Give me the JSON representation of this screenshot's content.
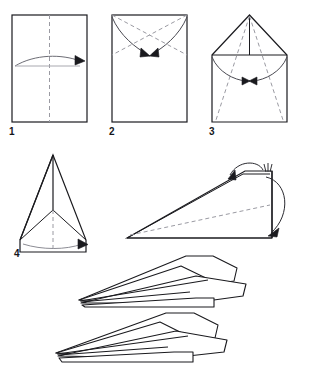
{
  "figure": {
    "type": "instructional-diagram",
    "background_color": "#ffffff",
    "ink_color": "#1a1a1e",
    "fold_line_color": "#9a9aa2",
    "arrow_color": "#6d6d75",
    "width": 311,
    "height": 376
  },
  "steps": [
    {
      "id": "step-1",
      "label": "1",
      "caption": "Rectangular sheet with vertical centre fold; fold in half and unfold.",
      "shape": "rectangle",
      "fold_lines": [
        "vertical-center-dashed"
      ],
      "arrows": [
        "curved-arrow-right"
      ]
    },
    {
      "id": "step-2",
      "label": "2",
      "caption": "Fold both top corners in to the centre line.",
      "shape": "rectangle",
      "fold_lines": [
        "diagonal-left-dashed",
        "diagonal-right-dashed"
      ],
      "arrows": [
        "curved-arrow-left-to-center",
        "curved-arrow-right-to-center"
      ]
    },
    {
      "id": "step-3",
      "label": "3",
      "caption": "Fold the new upper edges in to the centre line forming a point.",
      "shape": "house-pentagon",
      "fold_lines": [
        "diagonal-left-dashed",
        "diagonal-right-dashed",
        "vertical-center"
      ],
      "arrows": [
        "curved-arrow-left-to-center",
        "curved-arrow-right-to-center"
      ]
    },
    {
      "id": "step-4",
      "label": "4",
      "caption": "Fold the dart in half along the centre line.",
      "shape": "dart-triangle",
      "fold_lines": [
        "vertical-center-dashed"
      ],
      "arrows": [
        "curved-arrow-right"
      ]
    }
  ],
  "side_view": {
    "id": "step-5-side-view",
    "caption": "Side view: fold each wing down along the body line.",
    "fold_lines": [
      "long-diagonal-dashed"
    ],
    "arrows": [
      "curl-arrow-over-top",
      "curl-arrow-around-tail"
    ],
    "marks": [
      "crease-hatch-mark"
    ]
  },
  "results": [
    {
      "id": "finished-plane-upper",
      "caption": "Finished dart, three-quarter view."
    },
    {
      "id": "finished-plane-lower",
      "caption": "Finished dart, three-quarter view, wings spread."
    }
  ]
}
